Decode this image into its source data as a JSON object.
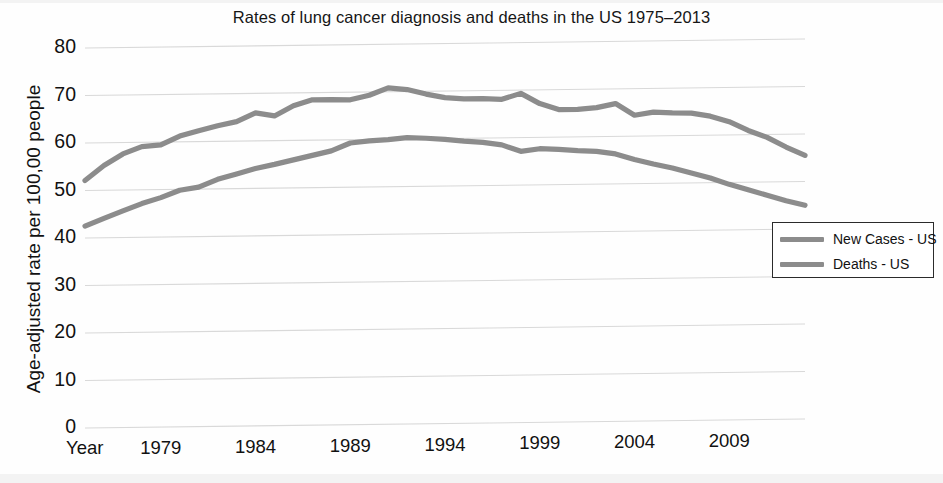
{
  "chart_data": {
    "type": "line",
    "title": "Rates of lung cancer diagnosis and deaths in the US 1975–2013",
    "xlabel": "Year",
    "ylabel": "Age-adjusted rate per 100,00 people",
    "xlim": [
      1975,
      2013
    ],
    "ylim": [
      0,
      80
    ],
    "grid": true,
    "legend_position": "right-middle",
    "x_axis_name": "Year",
    "x_ticks": [
      1979,
      1984,
      1989,
      1994,
      1999,
      2004,
      2009
    ],
    "x_tick_labels": [
      "1979",
      "1984",
      "1989",
      "1994",
      "1999",
      "2004",
      "2009"
    ],
    "y_ticks": [
      0,
      10,
      20,
      30,
      40,
      50,
      60,
      70,
      80
    ],
    "y_tick_labels": [
      "0",
      "10",
      "20",
      "30",
      "40",
      "50",
      "60",
      "70",
      "80"
    ],
    "x": [
      1975,
      1976,
      1977,
      1978,
      1979,
      1980,
      1981,
      1982,
      1983,
      1984,
      1985,
      1986,
      1987,
      1988,
      1989,
      1990,
      1991,
      1992,
      1993,
      1994,
      1995,
      1996,
      1997,
      1998,
      1999,
      2000,
      2001,
      2002,
      2003,
      2004,
      2005,
      2006,
      2007,
      2008,
      2009,
      2010,
      2011,
      2012,
      2013
    ],
    "series": [
      {
        "name": "New Cases - US",
        "color": "#8c8c8c",
        "values": [
          52.1,
          55.2,
          57.6,
          59.1,
          59.4,
          61.2,
          62.3,
          63.3,
          64.1,
          65.9,
          65.2,
          67.3,
          68.5,
          68.5,
          68.4,
          69.3,
          70.8,
          70.4,
          69.4,
          68.6,
          68.3,
          68.3,
          68.1,
          69.3,
          67.1,
          65.8,
          65.8,
          66.1,
          66.9,
          64.4,
          65.0,
          64.8,
          64.7,
          64.0,
          62.8,
          60.9,
          59.4,
          57.3,
          55.5
        ]
      },
      {
        "name": "Deaths - US",
        "color": "#8c8c8c",
        "values": [
          42.5,
          44.1,
          45.6,
          47.1,
          48.3,
          49.8,
          50.4,
          52.0,
          53.1,
          54.2,
          55.0,
          55.9,
          56.8,
          57.7,
          59.3,
          59.7,
          59.9,
          60.3,
          60.1,
          59.8,
          59.4,
          59.1,
          58.5,
          57.1,
          57.6,
          57.4,
          57.1,
          56.9,
          56.3,
          55.1,
          54.1,
          53.2,
          52.1,
          51.0,
          49.6,
          48.4,
          47.2,
          46.0,
          45.0
        ]
      }
    ]
  },
  "legend": {
    "items": [
      {
        "label": "New Cases - US",
        "color": "#8c8c8c"
      },
      {
        "label": "Deaths - US",
        "color": "#8c8c8c"
      }
    ]
  },
  "colors": {
    "gridline": "#d9d9d9",
    "line": "#8c8c8c",
    "text": "#111111",
    "legend_border": "#2b2b2b",
    "background": "#fefefe"
  }
}
